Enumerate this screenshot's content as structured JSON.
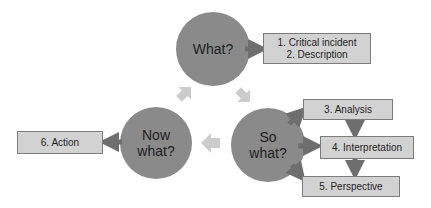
{
  "diagram": {
    "colors": {
      "circle_fill": "#8a8a8a",
      "box_fill": "#d2d2d2",
      "box_border": "#7c7c7c",
      "connector_arrow": "#6e6e6e",
      "cycle_arrow": "#cccccc"
    },
    "circles": [
      {
        "id": "what",
        "line1": "What?",
        "line2": ""
      },
      {
        "id": "so-what",
        "line1": "So",
        "line2": "what?"
      },
      {
        "id": "now-what",
        "line1": "Now",
        "line2": "what?"
      }
    ],
    "boxes": {
      "critical_incident": "1. Critical incident",
      "description": "2. Description",
      "analysis": "3. Analysis",
      "interpretation": "4. Interpretation",
      "perspective": "5. Perspective",
      "action": "6. Action"
    },
    "cycle_arrows": [
      {
        "from": "Now what?",
        "to": "What?",
        "direction": "up-right"
      },
      {
        "from": "What?",
        "to": "So what?",
        "direction": "down-right"
      },
      {
        "from": "So what?",
        "to": "Now what?",
        "direction": "left"
      }
    ]
  }
}
